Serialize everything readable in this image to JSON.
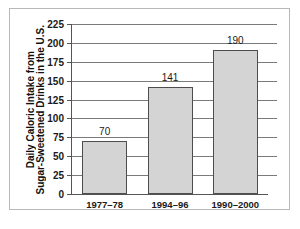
{
  "chart_data": {
    "type": "bar",
    "title": "",
    "xlabel": "",
    "ylabel": "Daily Caloric Intake from Sugar-Sweetened Drinks in the U.S.",
    "ylabel_lines": [
      "Daily Caloric Intake from",
      "Sugar-Sweetened Drinks in the U.S."
    ],
    "categories": [
      "1977–78",
      "1994–96",
      "1990–2000"
    ],
    "values": [
      70,
      141,
      190
    ],
    "value_labels": [
      "70",
      "141",
      "190"
    ],
    "ylim": [
      0,
      225
    ],
    "yticks": [
      225,
      200,
      175,
      150,
      125,
      100,
      75,
      50,
      25,
      0
    ],
    "ytick_labels": [
      "225",
      "200",
      "175",
      "150",
      "125",
      "100",
      "75",
      "50",
      "25",
      "0"
    ],
    "grid": true,
    "legend": false,
    "legend_position": "none",
    "bar_fill_color": "#d4d4d4",
    "bar_border_color": "#4d4d4d",
    "gridline_color": "#7a7a7a",
    "axis_color": "#555555",
    "background_color": "#ffffff",
    "frame_color": "#b8b8b8"
  }
}
